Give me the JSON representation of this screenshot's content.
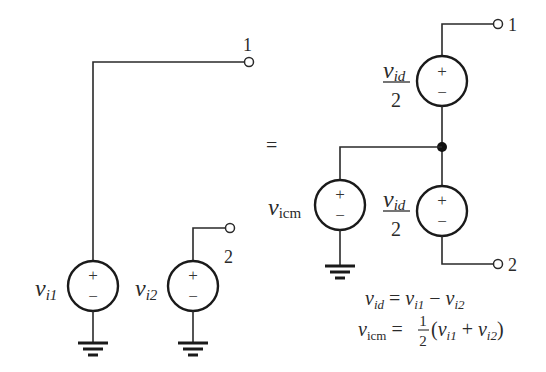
{
  "left_circuit": {
    "source1": {
      "label_main": "v",
      "label_sub": "i1",
      "plus": "+",
      "minus": "−"
    },
    "source2": {
      "label_main": "v",
      "label_sub": "i2",
      "plus": "+",
      "minus": "−"
    },
    "terminal1_label": "1",
    "terminal2_label": "2"
  },
  "equals_sign": "=",
  "right_circuit": {
    "top_source": {
      "label_num_main": "v",
      "label_num_sub": "id",
      "label_den": "2",
      "plus": "+",
      "minus": "−"
    },
    "common_source": {
      "label_main": "v",
      "label_sub": "icm",
      "plus": "+",
      "minus": "−"
    },
    "bottom_source": {
      "label_num_main": "v",
      "label_num_sub": "id",
      "label_den": "2",
      "plus": "+",
      "minus": "−"
    },
    "terminal1_label": "1",
    "terminal2_label": "2"
  },
  "equations": {
    "eq1": {
      "lhs_main": "v",
      "lhs_sub": "id",
      "eq": " = ",
      "a_main": "v",
      "a_sub": "i1",
      "op": " − ",
      "b_main": "v",
      "b_sub": "i2"
    },
    "eq2": {
      "lhs_main": "v",
      "lhs_sub": "icm",
      "eq": " = ",
      "frac_num": "1",
      "frac_den": "2",
      "open": "(",
      "a_main": "v",
      "a_sub": "i1",
      "op": " + ",
      "b_main": "v",
      "b_sub": "i2",
      "close": ")"
    }
  },
  "colors": {
    "line": "#2a2a2a",
    "background": "#ffffff"
  }
}
